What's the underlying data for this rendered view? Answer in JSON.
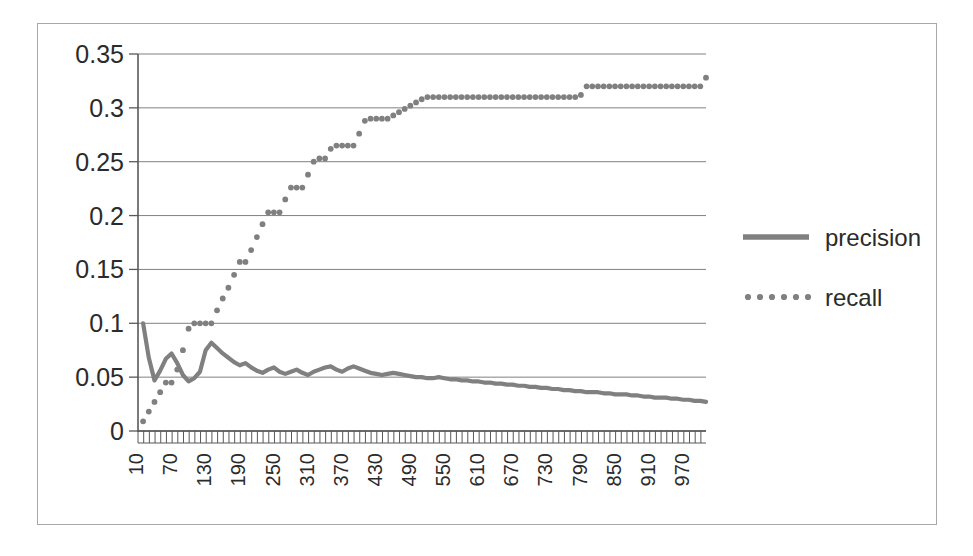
{
  "chart_data": {
    "type": "line",
    "title": "",
    "xlabel": "",
    "ylabel": "",
    "xlim": [
      1,
      1000
    ],
    "ylim": [
      0,
      0.35
    ],
    "grid": true,
    "legend_position": "right",
    "y_ticks": [
      "0",
      "0.05",
      "0.1",
      "0.15",
      "0.2",
      "0.25",
      "0.3",
      "0.35"
    ],
    "y_tick_values": [
      0,
      0.05,
      0.1,
      0.15,
      0.2,
      0.25,
      0.3,
      0.35
    ],
    "x_ticks": [
      "10",
      "70",
      "130",
      "190",
      "250",
      "310",
      "370",
      "430",
      "490",
      "550",
      "610",
      "670",
      "730",
      "790",
      "850",
      "910",
      "970"
    ],
    "x_tick_values": [
      10,
      70,
      130,
      190,
      250,
      310,
      370,
      430,
      490,
      550,
      610,
      670,
      730,
      790,
      850,
      910,
      970
    ],
    "x_minor_tick_step": 10,
    "series": [
      {
        "name": "precision",
        "style": "solid",
        "color": "#808080",
        "x": [
          10,
          20,
          30,
          40,
          50,
          60,
          70,
          80,
          90,
          100,
          110,
          120,
          130,
          140,
          150,
          160,
          170,
          180,
          190,
          200,
          210,
          220,
          230,
          240,
          250,
          260,
          270,
          280,
          290,
          300,
          310,
          320,
          330,
          340,
          350,
          360,
          370,
          380,
          390,
          400,
          410,
          420,
          430,
          440,
          450,
          460,
          470,
          480,
          490,
          500,
          510,
          520,
          530,
          540,
          550,
          560,
          570,
          580,
          590,
          600,
          610,
          620,
          630,
          640,
          650,
          660,
          670,
          680,
          690,
          700,
          710,
          720,
          730,
          740,
          750,
          760,
          770,
          780,
          790,
          800,
          810,
          820,
          830,
          840,
          850,
          860,
          870,
          880,
          890,
          900,
          910,
          920,
          930,
          940,
          950,
          960,
          970,
          980,
          990,
          1000
        ],
        "y": [
          0.1,
          0.068,
          0.047,
          0.056,
          0.067,
          0.072,
          0.063,
          0.052,
          0.046,
          0.049,
          0.055,
          0.075,
          0.082,
          0.077,
          0.072,
          0.068,
          0.064,
          0.061,
          0.063,
          0.059,
          0.056,
          0.054,
          0.057,
          0.059,
          0.055,
          0.053,
          0.055,
          0.057,
          0.054,
          0.052,
          0.055,
          0.057,
          0.059,
          0.06,
          0.057,
          0.055,
          0.058,
          0.06,
          0.058,
          0.056,
          0.054,
          0.053,
          0.052,
          0.053,
          0.054,
          0.053,
          0.052,
          0.051,
          0.05,
          0.05,
          0.049,
          0.049,
          0.05,
          0.049,
          0.048,
          0.048,
          0.047,
          0.047,
          0.046,
          0.046,
          0.045,
          0.045,
          0.044,
          0.044,
          0.043,
          0.043,
          0.042,
          0.042,
          0.041,
          0.041,
          0.04,
          0.04,
          0.039,
          0.039,
          0.038,
          0.038,
          0.037,
          0.037,
          0.036,
          0.036,
          0.036,
          0.035,
          0.035,
          0.034,
          0.034,
          0.034,
          0.033,
          0.033,
          0.032,
          0.032,
          0.031,
          0.031,
          0.031,
          0.03,
          0.03,
          0.029,
          0.029,
          0.028,
          0.028,
          0.027
        ]
      },
      {
        "name": "recall",
        "style": "dotted",
        "color": "#808080",
        "x": [
          10,
          20,
          30,
          40,
          50,
          60,
          70,
          80,
          90,
          100,
          110,
          120,
          130,
          140,
          150,
          160,
          170,
          180,
          190,
          200,
          210,
          220,
          230,
          240,
          250,
          260,
          270,
          280,
          290,
          300,
          310,
          320,
          330,
          340,
          350,
          360,
          370,
          380,
          390,
          400,
          410,
          420,
          430,
          440,
          450,
          460,
          470,
          480,
          490,
          500,
          510,
          520,
          530,
          540,
          550,
          560,
          570,
          580,
          590,
          600,
          610,
          620,
          630,
          640,
          650,
          660,
          670,
          680,
          690,
          700,
          710,
          720,
          730,
          740,
          750,
          760,
          770,
          780,
          790,
          800,
          810,
          820,
          830,
          840,
          850,
          860,
          870,
          880,
          890,
          900,
          910,
          920,
          930,
          940,
          950,
          960,
          970,
          980,
          990,
          1000
        ],
        "y": [
          0.009,
          0.018,
          0.027,
          0.036,
          0.045,
          0.045,
          0.057,
          0.075,
          0.095,
          0.1,
          0.1,
          0.1,
          0.1,
          0.112,
          0.123,
          0.133,
          0.145,
          0.157,
          0.157,
          0.168,
          0.18,
          0.192,
          0.203,
          0.203,
          0.203,
          0.215,
          0.226,
          0.226,
          0.226,
          0.238,
          0.25,
          0.253,
          0.253,
          0.262,
          0.265,
          0.265,
          0.265,
          0.265,
          0.276,
          0.288,
          0.29,
          0.29,
          0.29,
          0.29,
          0.293,
          0.296,
          0.299,
          0.302,
          0.305,
          0.308,
          0.31,
          0.31,
          0.31,
          0.31,
          0.31,
          0.31,
          0.31,
          0.31,
          0.31,
          0.31,
          0.31,
          0.31,
          0.31,
          0.31,
          0.31,
          0.31,
          0.31,
          0.31,
          0.31,
          0.31,
          0.31,
          0.31,
          0.31,
          0.31,
          0.31,
          0.31,
          0.31,
          0.312,
          0.32,
          0.32,
          0.32,
          0.32,
          0.32,
          0.32,
          0.32,
          0.32,
          0.32,
          0.32,
          0.32,
          0.32,
          0.32,
          0.32,
          0.32,
          0.32,
          0.32,
          0.32,
          0.32,
          0.32,
          0.32,
          0.328
        ]
      }
    ],
    "legend": [
      {
        "label": "precision",
        "style": "solid",
        "color": "#808080"
      },
      {
        "label": "recall",
        "style": "dotted",
        "color": "#808080"
      }
    ]
  },
  "colors": {
    "frame": "#a8a8a8",
    "axis": "#595959",
    "grid": "#808080",
    "series": "#808080",
    "text": "#2b2b2b",
    "background": "#ffffff"
  }
}
